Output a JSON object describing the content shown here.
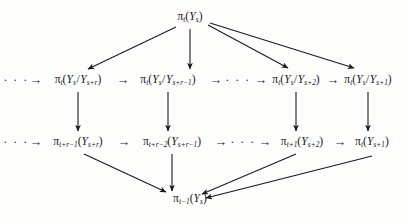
{
  "figure": {
    "kind": "commutative-diagram",
    "ink_color": "#1a1a1a",
    "background_color": "#fdfdfc"
  },
  "nodes": {
    "apex": {
      "id": "apex",
      "label": "πt(Ys)",
      "pi_sub": "t",
      "arg": "Y",
      "arg_sub": "s",
      "x": 190,
      "y": 17
    },
    "row1": [
      {
        "id": "r1c1",
        "label": "πt(Ys/Ys+r)",
        "pi_sub": "t",
        "num_sub": "s",
        "den_sub": "s+r",
        "x": 78,
        "y": 80
      },
      {
        "id": "r1c2",
        "label": "πt(Ys/Ys+r-1)",
        "pi_sub": "t",
        "num_sub": "s",
        "den_sub": "s+r−1",
        "x": 168,
        "y": 80
      },
      {
        "id": "r1c3",
        "label": "πt(Ys/Ys+2)",
        "pi_sub": "t",
        "num_sub": "s",
        "den_sub": "s+2",
        "x": 296,
        "y": 80
      },
      {
        "id": "r1c4",
        "label": "πt(Ys/Ys+1)",
        "pi_sub": "t",
        "num_sub": "s",
        "den_sub": "s+1",
        "x": 368,
        "y": 80
      }
    ],
    "row2": [
      {
        "id": "r2c1",
        "label": "πt+r-1(Ys+r)",
        "pi_sub": "t+r−1",
        "arg_sub": "s+r",
        "x": 78,
        "y": 142
      },
      {
        "id": "r2c2",
        "label": "πt+r-2(Ys+r-1)",
        "pi_sub": "t+r−2",
        "arg_sub": "s+r−1",
        "x": 172,
        "y": 142
      },
      {
        "id": "r2c3",
        "label": "πt+1(Ys+2)",
        "pi_sub": "t+1",
        "arg_sub": "s+2",
        "x": 302,
        "y": 142
      },
      {
        "id": "r2c4",
        "label": "πt(Ys+1)",
        "pi_sub": "t",
        "arg_sub": "s+1",
        "x": 372,
        "y": 142
      }
    ],
    "base": {
      "id": "base",
      "label": "πt-1(Ys)",
      "pi_sub": "t−1",
      "arg_sub": "s",
      "x": 190,
      "y": 199
    }
  },
  "ellipses": [
    {
      "id": "ell-r1-left",
      "text": "· · ·",
      "x": 16,
      "y": 80
    },
    {
      "id": "ell-r1-mid",
      "text": "· · ·",
      "x": 238,
      "y": 80
    },
    {
      "id": "ell-r2-left",
      "text": "· · ·",
      "x": 16,
      "y": 142
    },
    {
      "id": "ell-r2-mid",
      "text": "· · ·",
      "x": 243,
      "y": 142
    }
  ],
  "inline_arrows": [
    {
      "id": "a-r1-0",
      "glyph": "→",
      "x": 36,
      "y": 80
    },
    {
      "id": "a-r1-1",
      "glyph": "→",
      "x": 123,
      "y": 80
    },
    {
      "id": "a-r1-2",
      "glyph": "→",
      "x": 216,
      "y": 80
    },
    {
      "id": "a-r1-3",
      "glyph": "→",
      "x": 261,
      "y": 80
    },
    {
      "id": "a-r1-4",
      "glyph": "→",
      "x": 333,
      "y": 80
    },
    {
      "id": "a-r2-0",
      "glyph": "→",
      "x": 36,
      "y": 142
    },
    {
      "id": "a-r2-1",
      "glyph": "→",
      "x": 124,
      "y": 142
    },
    {
      "id": "a-r2-2",
      "glyph": "→",
      "x": 221,
      "y": 142
    },
    {
      "id": "a-r2-3",
      "glyph": "→",
      "x": 265,
      "y": 142
    },
    {
      "id": "a-r2-4",
      "glyph": "→",
      "x": 340,
      "y": 142
    }
  ],
  "edges": {
    "from_apex": [
      {
        "id": "apex-to-r1c1",
        "x1": 176,
        "y1": 27,
        "x2": 88,
        "y2": 69
      },
      {
        "id": "apex-to-r1c2",
        "x1": 190,
        "y1": 29,
        "x2": 190,
        "y2": 69
      },
      {
        "id": "apex-to-r1c3",
        "x1": 208,
        "y1": 25,
        "x2": 288,
        "y2": 68
      },
      {
        "id": "apex-to-r1c4",
        "x1": 210,
        "y1": 23,
        "x2": 354,
        "y2": 68
      }
    ],
    "verticals": [
      {
        "id": "r1c1-to-r2c1",
        "x1": 78,
        "y1": 92,
        "x2": 78,
        "y2": 131
      },
      {
        "id": "r1c2-to-r2c2",
        "x1": 168,
        "y1": 92,
        "x2": 168,
        "y2": 131
      },
      {
        "id": "r1c3-to-r2c3",
        "x1": 296,
        "y1": 92,
        "x2": 296,
        "y2": 131
      },
      {
        "id": "r1c4-to-r2c4",
        "x1": 368,
        "y1": 92,
        "x2": 368,
        "y2": 131
      }
    ],
    "to_base": [
      {
        "id": "r2c1-to-base",
        "x1": 84,
        "y1": 154,
        "x2": 166,
        "y2": 192
      },
      {
        "id": "r2c2-to-base",
        "x1": 172,
        "y1": 154,
        "x2": 172,
        "y2": 191
      },
      {
        "id": "r2c3-to-base",
        "x1": 296,
        "y1": 154,
        "x2": 202,
        "y2": 194
      },
      {
        "id": "r2c4-to-base",
        "x1": 372,
        "y1": 156,
        "x2": 206,
        "y2": 198
      }
    ]
  }
}
